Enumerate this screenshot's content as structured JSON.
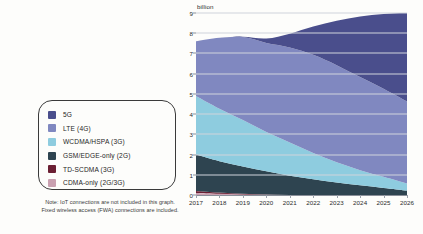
{
  "chart_data": {
    "type": "area",
    "title": "",
    "subtitle": "",
    "xlabel": "",
    "ylabel": "billion",
    "unit_label": "billion",
    "grid": true,
    "legend_position": "left",
    "x": [
      2017,
      2018,
      2019,
      2020,
      2021,
      2022,
      2023,
      2024,
      2025,
      2026
    ],
    "categories": [
      "2017",
      "2018",
      "2019",
      "2020",
      "2021",
      "2022",
      "2023",
      "2024",
      "2025",
      "2026"
    ],
    "ylim": [
      0,
      9
    ],
    "yticks": [
      0,
      1,
      2,
      3,
      4,
      5,
      6,
      7,
      8,
      9
    ],
    "ytick_labels": [
      "0",
      "1",
      "2",
      "3",
      "4",
      "5",
      "6",
      "7",
      "8",
      "9"
    ],
    "stacked": true,
    "stack_order_bottom_to_top": [
      "CDMA-only (2G/3G)",
      "TD-SCDMA (3G)",
      "GSM/EDGE-only (2G)",
      "WCDMA/HSPA (3G)",
      "LTE (4G)",
      "5G"
    ],
    "series": [
      {
        "name": "5G",
        "color": "#4a4e8c",
        "values": [
          0.0,
          0.0,
          0.01,
          0.22,
          0.68,
          1.4,
          2.2,
          3.0,
          3.7,
          4.4
        ]
      },
      {
        "name": "LTE (4G)",
        "color": "#8088c0",
        "values": [
          2.7,
          3.5,
          4.1,
          4.4,
          4.7,
          4.85,
          4.8,
          4.6,
          4.35,
          4.05
        ]
      },
      {
        "name": "WCDMA/HSPA (3G)",
        "color": "#8eccdf",
        "values": [
          2.9,
          2.6,
          2.3,
          1.95,
          1.65,
          1.3,
          1.0,
          0.75,
          0.55,
          0.35
        ]
      },
      {
        "name": "GSM/EDGE-only (2G)",
        "color": "#2e4450",
        "values": [
          1.8,
          1.55,
          1.35,
          1.15,
          0.95,
          0.78,
          0.62,
          0.48,
          0.35,
          0.22
        ]
      },
      {
        "name": "TD-SCDMA (3G)",
        "color": "#6b1f33",
        "values": [
          0.1,
          0.06,
          0.03,
          0.01,
          0.0,
          0.0,
          0.0,
          0.0,
          0.0,
          0.0
        ]
      },
      {
        "name": "CDMA-only (2G/3G)",
        "color": "#c9a0b0",
        "values": [
          0.1,
          0.06,
          0.03,
          0.01,
          0.0,
          0.0,
          0.0,
          0.0,
          0.0,
          0.0
        ]
      }
    ],
    "totals": [
      7.6,
      7.77,
      7.82,
      7.74,
      8.0,
      8.33,
      8.62,
      8.83,
      8.95,
      9.02
    ],
    "annotations": []
  },
  "legend": {
    "items": [
      {
        "label": "5G",
        "color": "#4a4e8c"
      },
      {
        "label": "LTE (4G)",
        "color": "#8088c0"
      },
      {
        "label": "WCDMA/HSPA (3G)",
        "color": "#8eccdf"
      },
      {
        "label": "GSM/EDGE-only (2G)",
        "color": "#2e4450"
      },
      {
        "label": "TD-SCDMA (3G)",
        "color": "#6b1f33"
      },
      {
        "label": "CDMA-only (2G/3G)",
        "color": "#c9a0b0"
      }
    ],
    "note_line1": "Note: IoT connections are not included in this graph.",
    "note_line2": "Fixed wireless access (FWA) connections are included."
  },
  "axis": {
    "y_unit": "billion",
    "y_ticks": [
      "0",
      "1",
      "2",
      "3",
      "4",
      "5",
      "6",
      "7",
      "8",
      "9"
    ],
    "x_ticks": [
      "2017",
      "2018",
      "2019",
      "2020",
      "2021",
      "2022",
      "2023",
      "2024",
      "2025",
      "2026"
    ]
  },
  "colors": {
    "grid": "#cfd3dc",
    "axis": "#8a8f99",
    "text": "#2b2b2b",
    "background": "#fdfdfb"
  }
}
